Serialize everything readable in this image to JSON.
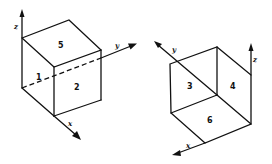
{
  "left_cube": {
    "faces": {
      "top": "5",
      "left": "1",
      "right": "2"
    },
    "axes": {
      "z": "z",
      "y": "y",
      "x": "x"
    }
  },
  "right_cube": {
    "faces": {
      "left": "3",
      "right": "4",
      "bottom": "6"
    },
    "axes": {
      "y": "y",
      "z": "z",
      "x": "x"
    }
  },
  "colors": {
    "ink": "#111111",
    "background": "#ffffff"
  }
}
